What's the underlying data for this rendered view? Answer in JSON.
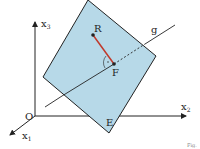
{
  "labels": {
    "x3": "x",
    "x3_sub": "3",
    "x2": "x",
    "x2_sub": "2",
    "x1": "x",
    "x1_sub": "1",
    "origin": "O",
    "point_r": "R",
    "point_f": "F",
    "line_g": "g",
    "plane_e": "E",
    "fig": "Fig."
  },
  "colors": {
    "plane": "#b7d9e8",
    "segment": "#c0392b",
    "line": "#222222"
  }
}
